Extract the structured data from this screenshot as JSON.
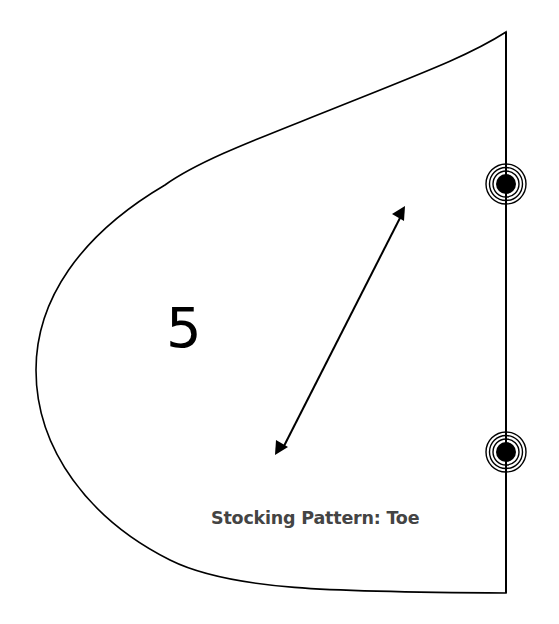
{
  "pattern": {
    "piece_number": "5",
    "piece_label": "Stocking Pattern: Toe",
    "stroke_color": "#000000",
    "label_color": "#444444",
    "background_color": "#ffffff"
  },
  "markings": {
    "grainline": {
      "type": "double-headed-arrow",
      "from": [
        280,
        453
      ],
      "to": [
        405,
        209
      ]
    },
    "notches": [
      {
        "type": "concentric-circle-marker",
        "center": [
          506,
          184
        ]
      },
      {
        "type": "concentric-circle-marker",
        "center": [
          506,
          452
        ]
      }
    ],
    "fold_edge": {
      "type": "straight-edge",
      "x": 506,
      "top": 32,
      "bottom": 593
    }
  }
}
